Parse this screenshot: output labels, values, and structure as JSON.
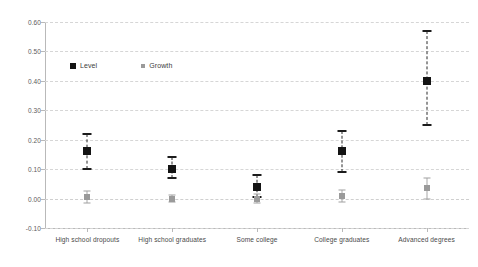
{
  "chart_data": {
    "type": "scatter",
    "title": "",
    "xlabel": "",
    "ylabel": "",
    "ylim": [
      -0.1,
      0.6
    ],
    "yticks": [
      0.6,
      0.5,
      0.4,
      0.3,
      0.2,
      0.1,
      0.0,
      -0.1
    ],
    "ytick_labels": [
      "0.60",
      "0.50",
      "0.40",
      "0.30",
      "0.20",
      "0.10",
      "0.00",
      "-0.10"
    ],
    "grid": true,
    "legend_position": "upper-left-inside",
    "categories": [
      "High school dropouts",
      "High school graduates",
      "Some college",
      "College graduates",
      "Advanced degrees"
    ],
    "series": [
      {
        "name": "Level",
        "marker": "filled-square",
        "color": "#141414",
        "values": [
          0.16,
          0.1,
          0.04,
          0.16,
          0.4
        ],
        "ci_low": [
          0.1,
          0.07,
          0.005,
          0.09,
          0.25
        ],
        "ci_high": [
          0.22,
          0.14,
          0.08,
          0.23,
          0.57
        ]
      },
      {
        "name": "Growth",
        "marker": "filled-square-small",
        "color": "#9a9a9a",
        "values": [
          0.005,
          0.0,
          0.0,
          0.01,
          0.035
        ],
        "ci_low": [
          -0.015,
          -0.01,
          -0.015,
          -0.01,
          0.0
        ],
        "ci_high": [
          0.025,
          0.012,
          0.015,
          0.03,
          0.07
        ]
      }
    ]
  },
  "legend": {
    "items": [
      {
        "label": "Level"
      },
      {
        "label": "Growth"
      }
    ]
  },
  "colors": {
    "level": "#141414",
    "growth": "#9a9a9a",
    "grid": "#d6d6d6",
    "axis": "#b9b9b9",
    "background": "#ffffff"
  }
}
